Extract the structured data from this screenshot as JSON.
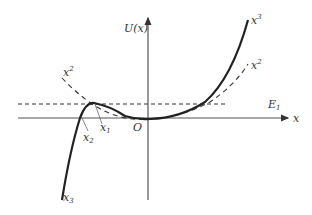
{
  "figure": {
    "y_axis_label": "U(x)",
    "x_axis_label": "x",
    "origin_label": "O",
    "energy_label": "E",
    "energy_subscript": "1",
    "curve_labels": {
      "cubic_top": {
        "base": "x",
        "sup": "3"
      },
      "cubic_bottom": {
        "base": "x",
        "sub": "3"
      },
      "quadratic_left": {
        "base": "x",
        "sup": "2"
      },
      "quadratic_right": {
        "base": "x",
        "sup": "2"
      }
    },
    "point_labels": {
      "x1": {
        "base": "x",
        "sub": "1"
      },
      "x2": {
        "base": "x",
        "sub": "2"
      }
    }
  },
  "colors": {
    "axis": "#555555",
    "curve": "#222222",
    "dashed": "#333333"
  }
}
